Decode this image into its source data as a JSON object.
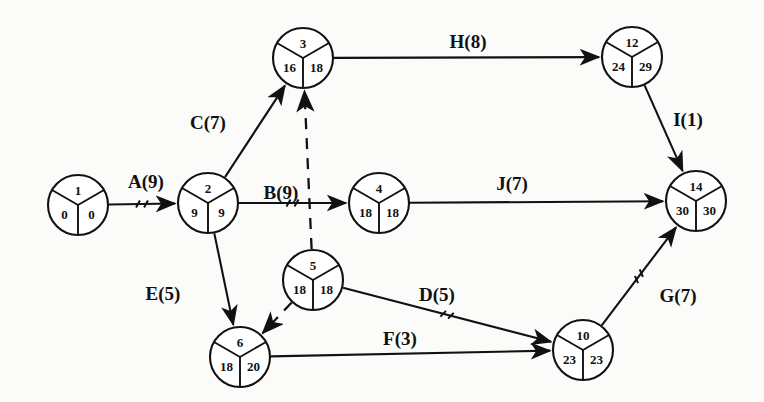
{
  "diagram": {
    "stroke_color": "#111111",
    "background_color": "#fbfbf9",
    "nodes": [
      {
        "id": "1",
        "label": "1",
        "early": "0",
        "late": "0",
        "cx": 78,
        "cy": 205,
        "r": 30
      },
      {
        "id": "2",
        "label": "2",
        "early": "9",
        "late": "9",
        "cx": 208,
        "cy": 203,
        "r": 30
      },
      {
        "id": "3",
        "label": "3",
        "early": "16",
        "late": "18",
        "cx": 303,
        "cy": 58,
        "r": 30
      },
      {
        "id": "4",
        "label": "4",
        "early": "18",
        "late": "18",
        "cx": 379,
        "cy": 203,
        "r": 30
      },
      {
        "id": "5",
        "label": "5",
        "early": "18",
        "late": "18",
        "cx": 313,
        "cy": 280,
        "r": 30
      },
      {
        "id": "6",
        "label": "6",
        "early": "18",
        "late": "20",
        "cx": 240,
        "cy": 357,
        "r": 30
      },
      {
        "id": "10",
        "label": "10",
        "early": "23",
        "late": "23",
        "cx": 583,
        "cy": 350,
        "r": 30
      },
      {
        "id": "12",
        "label": "12",
        "early": "24",
        "late": "29",
        "cx": 632,
        "cy": 57,
        "r": 30
      },
      {
        "id": "14",
        "label": "14",
        "early": "30",
        "late": "30",
        "cx": 696,
        "cy": 201,
        "r": 30
      }
    ],
    "edges": [
      {
        "name": "A",
        "label": "A(9)",
        "from": "1",
        "to": "2",
        "style": "solid",
        "tick": true,
        "label_x": 146,
        "label_y": 184
      },
      {
        "name": "C",
        "label": "C(7)",
        "from": "2",
        "to": "3",
        "style": "solid",
        "tick": false,
        "label_x": 208,
        "label_y": 125
      },
      {
        "name": "B",
        "label": "B(9)",
        "from": "2",
        "to": "4",
        "style": "solid",
        "tick": true,
        "label_x": 281,
        "label_y": 195
      },
      {
        "name": "E",
        "label": "E(5)",
        "from": "2",
        "to": "6",
        "style": "solid",
        "tick": false,
        "label_x": 163,
        "label_y": 296
      },
      {
        "name": "H",
        "label": "H(8)",
        "from": "3",
        "to": "12",
        "style": "solid",
        "tick": false,
        "label_x": 468,
        "label_y": 44
      },
      {
        "name": "I",
        "label": "I(1)",
        "from": "12",
        "to": "14",
        "style": "solid",
        "tick": false,
        "label_x": 688,
        "label_y": 122
      },
      {
        "name": "J",
        "label": "J(7)",
        "from": "4",
        "to": "14",
        "style": "solid",
        "tick": false,
        "label_x": 512,
        "label_y": 186
      },
      {
        "name": "D",
        "label": "D(5)",
        "from": "5",
        "to": "10",
        "style": "solid",
        "tick": true,
        "label_x": 437,
        "label_y": 297
      },
      {
        "name": "F",
        "label": "F(3)",
        "from": "6",
        "to": "10",
        "style": "solid",
        "tick": false,
        "label_x": 400,
        "label_y": 341
      },
      {
        "name": "G",
        "label": "G(7)",
        "from": "10",
        "to": "14",
        "style": "solid",
        "tick": true,
        "label_x": 678,
        "label_y": 298
      },
      {
        "name": "dummy-5-3",
        "label": "",
        "from": "5",
        "to": "3",
        "style": "dashed",
        "tick": false,
        "label_x": 0,
        "label_y": 0
      },
      {
        "name": "dummy-5-6",
        "label": "",
        "from": "5",
        "to": "6",
        "style": "dashed",
        "tick": false,
        "label_x": 0,
        "label_y": 0
      }
    ],
    "legend_note": ""
  }
}
